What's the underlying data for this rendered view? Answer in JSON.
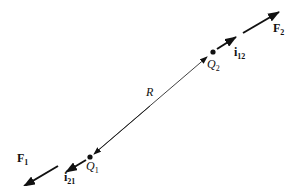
{
  "diagram": {
    "labels": {
      "R": "R",
      "Q1": {
        "base": "Q",
        "sub": "1"
      },
      "Q2": {
        "base": "Q",
        "sub": "2"
      },
      "F1": {
        "base": "F",
        "sub": "1"
      },
      "F2": {
        "base": "F",
        "sub": "2"
      },
      "i21": {
        "base": "i",
        "sub": "21"
      },
      "i12": {
        "base": "i",
        "sub": "12"
      }
    },
    "colors": {
      "line": "#111111",
      "background": "#ffffff"
    }
  }
}
